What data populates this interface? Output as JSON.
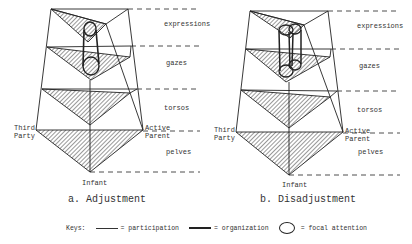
{
  "figures": [
    {
      "id": "a",
      "caption": "a. Adjustment",
      "levels": [
        "expressions",
        "gazes",
        "torsos",
        "pelves"
      ],
      "vertices": {
        "left": "Third Party",
        "right": "Active Parent",
        "bottom": "Infant"
      },
      "left_label_line1": "Third",
      "left_label_line2": "Party",
      "right_label_line1": "Active",
      "right_label_line2": "Parent",
      "bottom_label": "Infant",
      "focal_attention": "single cylinder linking expressions and gazes"
    },
    {
      "id": "b",
      "caption": "b. Disadjustment",
      "levels": [
        "expressions",
        "gazes",
        "torsos",
        "pelves"
      ],
      "vertices": {
        "left": "Third Party",
        "right": "Active Parent",
        "bottom": "Infant"
      },
      "left_label_line1": "Third",
      "left_label_line2": "Party",
      "right_label_line1": "Active",
      "right_label_line2": "Parent",
      "bottom_label": "Infant",
      "focal_attention": "two overlapping cylinders linking expressions and gazes"
    }
  ],
  "keys": {
    "title": "Keys:",
    "participation": "= participation",
    "organization": "= organization",
    "focal_attention": "= focal attention"
  },
  "colors": {
    "ink": "#222222",
    "background": "#ffffff"
  }
}
